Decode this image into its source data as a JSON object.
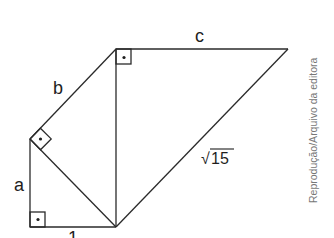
{
  "figure": {
    "labels": {
      "a": "a",
      "b": "b",
      "c": "c",
      "one": "1",
      "hyp_radical": "√",
      "hyp_value": "15"
    },
    "right_angle_mark": "•",
    "credit": "Reprodução/Arquivo da editora",
    "colors": {
      "line": "#2a2a2a",
      "text": "#1e1e1e",
      "credit": "#777777"
    }
  }
}
